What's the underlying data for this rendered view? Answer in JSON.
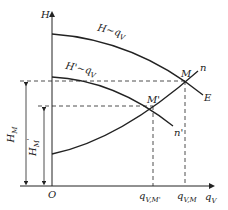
{
  "diagram": {
    "type": "pump-performance-curves",
    "axes": {
      "y_label": "H",
      "x_label": "q",
      "x_label_sub": "V",
      "origin_label": "O"
    },
    "curves": [
      {
        "id": "pump-curve",
        "label": "H~q",
        "label_sub": "V",
        "end_label": "E"
      },
      {
        "id": "pump-curve-prime",
        "label": "H'~q",
        "label_sub": "V",
        "end_label": "n'"
      },
      {
        "id": "system-curve",
        "end_label": "n"
      }
    ],
    "points": [
      {
        "id": "M",
        "label": "M"
      },
      {
        "id": "M-prime",
        "label": "M'"
      }
    ],
    "dimensions": {
      "H_M": {
        "label": "H",
        "sub": "M"
      },
      "H_M_prime": {
        "label": "H",
        "sub": "M",
        "sup": "'"
      }
    },
    "x_ticks": [
      {
        "label": "q",
        "sub": "V,M'"
      },
      {
        "label": "q",
        "sub": "V,M"
      }
    ],
    "colors": {
      "line": "#222222",
      "background": "#ffffff"
    }
  }
}
